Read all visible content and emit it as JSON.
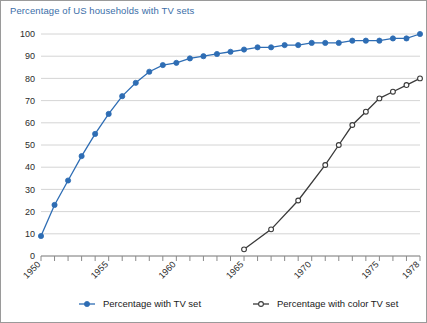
{
  "chart_data": {
    "type": "line",
    "title": "Percentage of US households with TV sets",
    "xlabel": "",
    "ylabel": "",
    "xlim": [
      1950,
      1978
    ],
    "ylim": [
      0,
      100
    ],
    "grid": true,
    "legend_position": "bottom",
    "y_ticks": [
      0,
      10,
      20,
      30,
      40,
      50,
      60,
      70,
      80,
      90,
      100
    ],
    "x_ticks": [
      1950,
      1951,
      1952,
      1953,
      1954,
      1955,
      1956,
      1957,
      1958,
      1959,
      1960,
      1961,
      1962,
      1963,
      1964,
      1965,
      1966,
      1967,
      1968,
      1969,
      1970,
      1971,
      1972,
      1973,
      1974,
      1975,
      1976,
      1977,
      1978
    ],
    "x_tick_labels": [
      {
        "value": 1950,
        "label": "1950"
      },
      {
        "value": 1955,
        "label": "1955"
      },
      {
        "value": 1960,
        "label": "1960"
      },
      {
        "value": 1965,
        "label": "1965"
      },
      {
        "value": 1970,
        "label": "1970"
      },
      {
        "value": 1975,
        "label": "1975"
      },
      {
        "value": 1978,
        "label": "1978"
      }
    ],
    "series": [
      {
        "name": "Percentage with TV set",
        "color": "#2E6DB4",
        "marker": "filled-circle",
        "x": [
          1950,
          1951,
          1952,
          1953,
          1954,
          1955,
          1956,
          1957,
          1958,
          1959,
          1960,
          1961,
          1962,
          1963,
          1964,
          1965,
          1966,
          1967,
          1968,
          1969,
          1970,
          1971,
          1972,
          1973,
          1974,
          1975,
          1976,
          1977,
          1978
        ],
        "values": [
          9,
          23,
          34,
          45,
          55,
          64,
          72,
          78,
          83,
          86,
          87,
          89,
          90,
          91,
          92,
          93,
          94,
          94,
          95,
          95,
          96,
          96,
          96,
          97,
          97,
          97,
          98,
          98,
          100
        ]
      },
      {
        "name": "Percentage with color TV set",
        "color": "#3a3a3a",
        "marker": "open-circle",
        "x": [
          1965,
          1967,
          1969,
          1971,
          1972,
          1973,
          1974,
          1975,
          1976,
          1977,
          1978
        ],
        "values": [
          3,
          12,
          25,
          41,
          50,
          59,
          65,
          71,
          74,
          77,
          80
        ]
      }
    ]
  },
  "legend": {
    "items": [
      {
        "label": "Percentage with TV set",
        "color": "#2E6DB4",
        "marker": "filled-circle"
      },
      {
        "label": "Percentage with color TV set",
        "color": "#3a3a3a",
        "marker": "open-circle"
      }
    ]
  }
}
